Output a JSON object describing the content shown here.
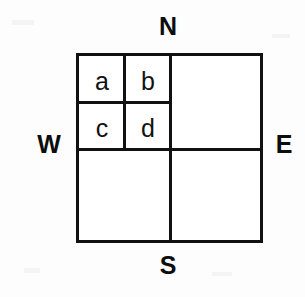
{
  "figure": {
    "background_color": "#fdfdfd",
    "line_color": "#111111",
    "cell_fill_color": "#ffffff"
  },
  "compass": {
    "north": "N",
    "south": "S",
    "west": "W",
    "east": "E"
  },
  "cells": {
    "nw_nw": "a",
    "nw_ne": "b",
    "nw_sw": "c",
    "nw_se": "d"
  }
}
